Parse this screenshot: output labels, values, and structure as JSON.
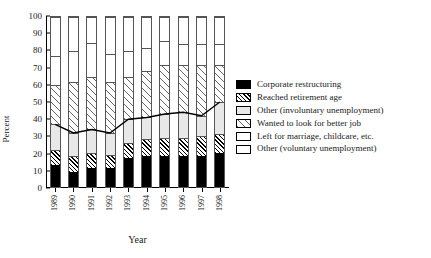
{
  "chart_data": {
    "type": "bar",
    "title": "",
    "xlabel": "Year",
    "ylabel": "Percent",
    "ylim": [
      0,
      100
    ],
    "yticks": [
      0,
      10,
      20,
      30,
      40,
      50,
      60,
      70,
      80,
      90,
      100
    ],
    "grid": false,
    "stacked": true,
    "stack_order_bottom_to_top": [
      "Corporate restructuring",
      "Reached retirement age",
      "Other (involuntary unemployment)",
      "Wanted to look for better job",
      "Left for marriage, childcare, etc.",
      "Other (voluntary unemployment)"
    ],
    "categories": [
      "1989",
      "1990",
      "1991",
      "1992",
      "1993",
      "1994",
      "1995",
      "1996",
      "1997",
      "1998"
    ],
    "series": [
      {
        "name": "Corporate restructuring",
        "fill": "solid-black",
        "values": [
          13,
          9,
          11,
          11,
          17,
          18,
          18,
          18,
          18,
          20
        ]
      },
      {
        "name": "Reached retirement age",
        "fill": "dense-diagonal",
        "values": [
          9,
          9,
          9,
          8,
          9,
          10,
          11,
          11,
          12,
          11
        ]
      },
      {
        "name": "Other (involuntary unemployment)",
        "fill": "light-gray",
        "values": [
          15,
          14,
          14,
          13,
          14,
          13,
          14,
          15,
          12,
          19
        ]
      },
      {
        "name": "Wanted to look for better job",
        "fill": "wide-diagonal",
        "values": [
          23,
          30,
          31,
          30,
          25,
          27,
          29,
          28,
          30,
          22
        ]
      },
      {
        "name": "Left for marriage, childcare, etc.",
        "fill": "white",
        "values": [
          17,
          18,
          20,
          16,
          15,
          14,
          14,
          12,
          12,
          12
        ]
      },
      {
        "name": "Other (voluntary unemployment)",
        "fill": "white",
        "values": [
          23,
          20,
          15,
          22,
          20,
          18,
          14,
          16,
          16,
          16
        ]
      }
    ],
    "overlay_line": {
      "name": "Involuntary unemployment total",
      "values": [
        37,
        32,
        34,
        32,
        40,
        41,
        43,
        44,
        42,
        50
      ]
    }
  },
  "legend": {
    "position": "right",
    "items": [
      {
        "label": "Corporate restructuring",
        "swatch": "solid-black"
      },
      {
        "label": "Reached retirement age",
        "swatch": "dense-diagonal"
      },
      {
        "label": "Other (involuntary unemployment)",
        "swatch": "light-gray"
      },
      {
        "label": "Wanted to look for better job",
        "swatch": "wide-diagonal"
      },
      {
        "label": "Left for marriage, childcare, etc.",
        "swatch": "white"
      },
      {
        "label": "Other (voluntary unemployment)",
        "swatch": "white"
      }
    ]
  }
}
